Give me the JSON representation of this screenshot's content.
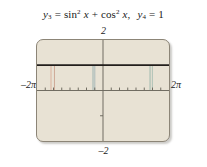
{
  "caption": {
    "fn1_var": "y",
    "fn1_sub": "3",
    "fn1_eq": "=",
    "fn1_expr_a": "sin",
    "fn1_expr_a_sup": "2",
    "fn1_expr_a_arg": "x",
    "fn1_plus": "+",
    "fn1_expr_b": "cos",
    "fn1_expr_b_sup": "2",
    "fn1_expr_b_arg": "x",
    "comma": ",",
    "fn2_var": "y",
    "fn2_sub": "4",
    "fn2_eq": "=",
    "fn2_val": "1"
  },
  "graph": {
    "label_top": "2",
    "label_bottom": "–2",
    "label_left": "–2π",
    "label_right": "2π",
    "screen_bg": "#e8e2d4",
    "screen_border": "#8c8577",
    "axis_color": "#6e6a60",
    "curve_color": "#231f1c",
    "tick_color": "#6e6a60"
  },
  "chart_data": {
    "type": "line",
    "xlabel": "",
    "ylabel": "",
    "xlim": [
      -6.283185,
      6.283185
    ],
    "ylim": [
      -2,
      2
    ],
    "grid": false,
    "legend": "none",
    "x_tick_labels": [
      "–2π",
      "2π"
    ],
    "y_tick_labels": [
      "2",
      "–2"
    ],
    "x_tick_values": [
      -5.497787,
      -4.712389,
      -3.926991,
      -3.141593,
      -2.356194,
      -1.570796,
      -0.785398,
      0.785398,
      1.570796,
      2.356194,
      3.141593,
      3.926991,
      4.712389,
      5.497787
    ],
    "y_tick_values": [
      1,
      -1
    ],
    "series": [
      {
        "name": "y3 = sin^2 x + cos^2 x",
        "type": "line",
        "color": "#231f1c",
        "constant_value": 1,
        "x": [
          -6.283185,
          6.283185
        ],
        "values": [
          1,
          1
        ]
      },
      {
        "name": "y4 = 1",
        "type": "line",
        "color": "#231f1c",
        "constant_value": 1,
        "x": [
          -6.283185,
          6.283185
        ],
        "values": [
          1,
          1
        ]
      }
    ],
    "annotations": [
      {
        "name": "artifact-line-1",
        "x": -4.95,
        "color": "#d8a893"
      },
      {
        "name": "artifact-line-2",
        "x": -4.62,
        "color": "#caa08c"
      },
      {
        "name": "artifact-line-3",
        "x": -0.95,
        "color": "#8fa9ad"
      },
      {
        "name": "artifact-line-4",
        "x": -0.78,
        "color": "#9db3b5"
      },
      {
        "name": "artifact-line-5",
        "x": 4.48,
        "color": "#8fb0a5"
      },
      {
        "name": "artifact-line-6",
        "x": 4.7,
        "color": "#a2bcb0"
      }
    ]
  }
}
